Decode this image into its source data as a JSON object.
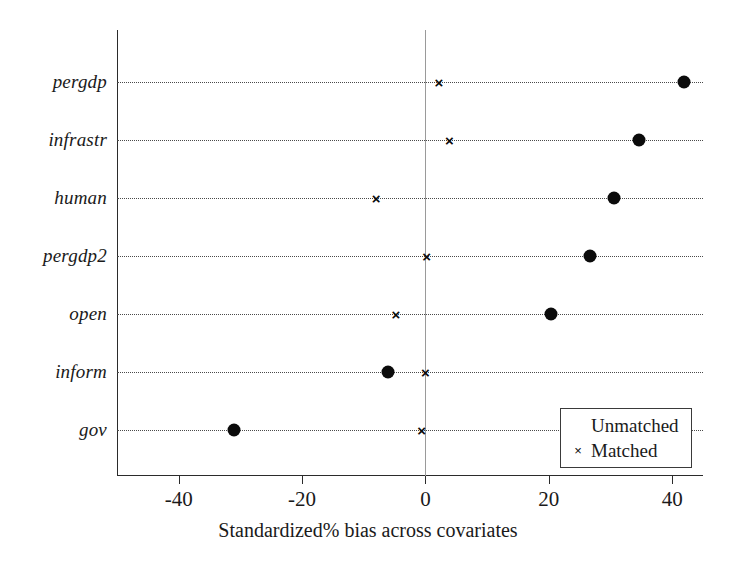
{
  "chart_data": {
    "type": "scatter",
    "title": "",
    "subtitle": "",
    "xlabel": "Standardized% bias  across covariates",
    "ylabel": "",
    "xlim": [
      -50,
      45
    ],
    "ylim": [
      0,
      8
    ],
    "grid": "horizontal-dotted",
    "zero_reference_line": 0,
    "categories": [
      "pergdp",
      "infrastr",
      "human",
      "pergdp2",
      "open",
      "inform",
      "gov"
    ],
    "xticks": [
      -40,
      -20,
      0,
      20,
      40
    ],
    "xtick_labels": [
      "-40",
      "-20",
      "0",
      "20",
      "40"
    ],
    "series": [
      {
        "name": "Unmatched",
        "marker": "filled-circle",
        "color": "#0b0b0b",
        "values": [
          42.0,
          34.7,
          30.6,
          26.7,
          20.3,
          -6.0,
          -31.0
        ]
      },
      {
        "name": "Matched",
        "marker": "cross",
        "color": "#0b0b0b",
        "values": [
          2.2,
          3.9,
          -8.0,
          0.2,
          -4.8,
          0.0,
          -0.6
        ]
      }
    ],
    "legend": {
      "position": "bottom-right",
      "entries": [
        {
          "symbol": "filled-circle",
          "label": "Unmatched"
        },
        {
          "symbol": "cross",
          "label": "Matched"
        }
      ]
    }
  },
  "glyphs": {
    "cross": "×"
  }
}
